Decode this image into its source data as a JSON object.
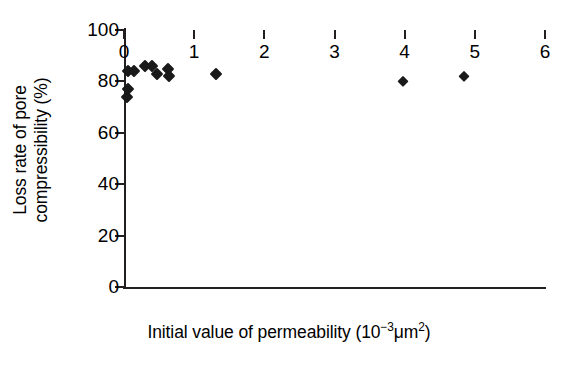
{
  "chart_data": {
    "type": "scatter",
    "title": "",
    "xlabel": "Initial value of permeability (10−3μm2)",
    "xlabel_parts": {
      "prefix": "Initial value of permeability (10",
      "exp1": "−3",
      "mid": "μm",
      "exp2": "2",
      "suffix": ")"
    },
    "ylabel": "Loss rate of pore compressibility (%)",
    "ylabel_line1": "Loss rate of pore",
    "ylabel_line2": "compressibility (%)",
    "xlim": [
      0,
      6
    ],
    "ylim": [
      0,
      100
    ],
    "xticks": [
      0,
      1,
      2,
      3,
      4,
      5,
      6
    ],
    "yticks": [
      0,
      20,
      40,
      60,
      80,
      100
    ],
    "xticklabels": [
      "0",
      "1",
      "2",
      "3",
      "4",
      "5",
      "6"
    ],
    "yticklabels": [
      "0",
      "20",
      "40",
      "60",
      "80",
      "100"
    ],
    "grid": false,
    "legend": false,
    "marker": "filled-diamond",
    "marker_color": "#1a1a1a",
    "series": [
      {
        "name": "Samples",
        "points": [
          {
            "x": 0.04,
            "y": 74
          },
          {
            "x": 0.05,
            "y": 77
          },
          {
            "x": 0.06,
            "y": 84
          },
          {
            "x": 0.14,
            "y": 84
          },
          {
            "x": 0.3,
            "y": 86
          },
          {
            "x": 0.4,
            "y": 86
          },
          {
            "x": 0.47,
            "y": 83
          },
          {
            "x": 0.63,
            "y": 85
          },
          {
            "x": 0.64,
            "y": 82
          },
          {
            "x": 1.31,
            "y": 83
          },
          {
            "x": 3.98,
            "y": 80
          },
          {
            "x": 4.85,
            "y": 82
          }
        ]
      }
    ]
  }
}
